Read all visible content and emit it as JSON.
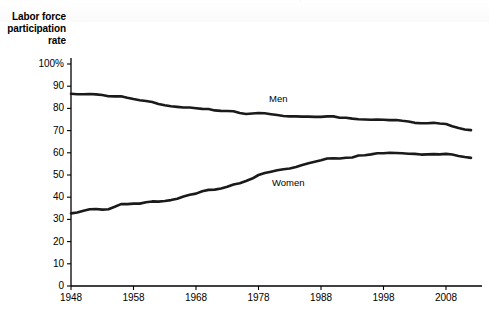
{
  "chart_data": {
    "type": "line",
    "title": "",
    "ylabel": "Labor force participation rate",
    "xlabel": "",
    "ylim": [
      0,
      100
    ],
    "xlim": [
      1948,
      2012
    ],
    "grid": false,
    "legend_position": "inline-annotations",
    "ytick_labels": [
      "100%",
      "90",
      "80",
      "70",
      "60",
      "50",
      "40",
      "30",
      "20",
      "10",
      "0"
    ],
    "ytick_values": [
      100,
      90,
      80,
      70,
      60,
      50,
      40,
      30,
      20,
      10,
      0
    ],
    "xtick_labels": [
      "1948",
      "1958",
      "1968",
      "1978",
      "1988",
      "1998",
      "2008"
    ],
    "xtick_values": [
      1948,
      1958,
      1968,
      1978,
      1988,
      1998,
      2008
    ],
    "x": [
      1948,
      1949,
      1950,
      1951,
      1952,
      1953,
      1954,
      1955,
      1956,
      1957,
      1958,
      1959,
      1960,
      1961,
      1962,
      1963,
      1964,
      1965,
      1966,
      1967,
      1968,
      1969,
      1970,
      1971,
      1972,
      1973,
      1974,
      1975,
      1976,
      1977,
      1978,
      1979,
      1980,
      1981,
      1982,
      1983,
      1984,
      1985,
      1986,
      1987,
      1988,
      1989,
      1990,
      1991,
      1992,
      1993,
      1994,
      1995,
      1996,
      1997,
      1998,
      1999,
      2000,
      2001,
      2002,
      2003,
      2004,
      2005,
      2006,
      2007,
      2008,
      2009,
      2010,
      2011,
      2012
    ],
    "series": [
      {
        "name": "Men",
        "annotation": "Men",
        "values": [
          86.6,
          86.4,
          86.4,
          86.5,
          86.3,
          86.0,
          85.5,
          85.4,
          85.5,
          84.8,
          84.2,
          83.7,
          83.3,
          82.9,
          82.0,
          81.4,
          81.0,
          80.7,
          80.4,
          80.4,
          80.1,
          79.8,
          79.7,
          79.1,
          78.9,
          78.8,
          78.7,
          77.9,
          77.5,
          77.7,
          77.9,
          77.8,
          77.4,
          77.0,
          76.6,
          76.4,
          76.4,
          76.3,
          76.3,
          76.2,
          76.2,
          76.4,
          76.4,
          75.8,
          75.8,
          75.4,
          75.1,
          75.0,
          74.9,
          75.0,
          74.9,
          74.7,
          74.8,
          74.4,
          74.1,
          73.5,
          73.3,
          73.3,
          73.5,
          73.2,
          73.0,
          72.0,
          71.2,
          70.5,
          70.2
        ],
        "color": "#1a1a1a"
      },
      {
        "name": "Women",
        "annotation": "Women",
        "values": [
          32.7,
          33.1,
          33.9,
          34.6,
          34.7,
          34.4,
          34.6,
          35.7,
          36.9,
          36.9,
          37.1,
          37.1,
          37.7,
          38.1,
          38.0,
          38.3,
          38.7,
          39.3,
          40.3,
          41.1,
          41.6,
          42.7,
          43.3,
          43.4,
          43.9,
          44.7,
          45.7,
          46.3,
          47.3,
          48.4,
          50.0,
          50.9,
          51.5,
          52.1,
          52.6,
          52.9,
          53.6,
          54.5,
          55.3,
          56.0,
          56.6,
          57.4,
          57.5,
          57.4,
          57.8,
          57.9,
          58.8,
          58.9,
          59.3,
          59.8,
          59.8,
          60.0,
          59.9,
          59.8,
          59.6,
          59.5,
          59.2,
          59.3,
          59.4,
          59.3,
          59.5,
          59.2,
          58.6,
          58.1,
          57.7
        ],
        "color": "#1a1a1a"
      }
    ]
  }
}
